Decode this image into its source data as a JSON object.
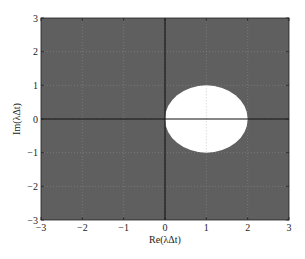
{
  "chart_data": {
    "type": "region",
    "title": "",
    "xlabel": "Re(λΔt)",
    "ylabel": "Im(λΔt)",
    "xlim": [
      -3,
      3
    ],
    "ylim": [
      -3,
      3
    ],
    "xticks": [
      -3,
      -2,
      -1,
      0,
      1,
      2,
      3
    ],
    "yticks": [
      -3,
      -2,
      -1,
      0,
      1,
      2,
      3
    ],
    "xtick_labels": [
      "−3",
      "−2",
      "−1",
      "0",
      "1",
      "2",
      "3"
    ],
    "ytick_labels": [
      "−3",
      "−2",
      "−1",
      "0",
      "1",
      "2",
      "3"
    ],
    "grid": true,
    "grid_style": "dotted",
    "background_region": {
      "description": "shaded (outside stability region)",
      "color": "#5f5f5f"
    },
    "regions": [
      {
        "shape": "circle",
        "center": [
          1,
          0
        ],
        "radius": 1,
        "fill": "#ffffff",
        "description": "unshaded disk |1 - λΔt| ≤ 1"
      }
    ],
    "reference_lines": [
      {
        "orientation": "vertical",
        "x": 0,
        "color": "#111111"
      },
      {
        "orientation": "horizontal",
        "y": 0,
        "color": "#111111"
      }
    ],
    "legend": null
  },
  "colors": {
    "shaded": "#5f5f5f",
    "disk": "#ffffff",
    "axis": "#111111",
    "grid": "#888888"
  }
}
